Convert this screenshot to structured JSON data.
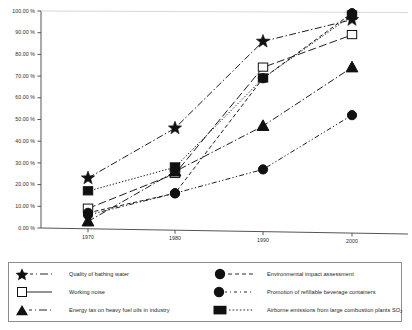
{
  "chart_data": {
    "type": "line",
    "title": "",
    "xlabel": "",
    "ylabel": "",
    "x": [
      1970,
      1980,
      1990,
      2000
    ],
    "categories": [
      "1970",
      "1980",
      "1990",
      "2000"
    ],
    "xtick_labels": [
      "1970",
      "1980",
      "1990",
      "2000"
    ],
    "ytick_labels": [
      "0.00 %",
      "10.00 %",
      "20.00 %",
      "30.00 %",
      "40.00 %",
      "50.00 %",
      "60.00 %",
      "70.00 %",
      "80.00 %",
      "90.00 %",
      "100.00 %"
    ],
    "ytick_values": [
      0,
      10,
      20,
      30,
      40,
      50,
      60,
      70,
      80,
      90,
      100
    ],
    "ylim": [
      0,
      100
    ],
    "xlim": [
      1965,
      2005
    ],
    "grid": false,
    "legend_position": "bottom",
    "series": [
      {
        "name": "Quality of bathing water",
        "marker": "star",
        "marker_fill": "solid",
        "dash": "dash-dot",
        "values": [
          23,
          46,
          86,
          96
        ]
      },
      {
        "name": "Working noise",
        "marker": "square",
        "marker_fill": "open",
        "dash": "long-dash",
        "values": [
          9,
          25,
          74,
          89
        ]
      },
      {
        "name": "Energy tax on heavy fuel oils in industry",
        "marker": "triangle",
        "marker_fill": "solid",
        "dash": "dash-dot",
        "values": [
          3,
          26,
          47,
          74
        ]
      },
      {
        "name": "Environmental impact assessment",
        "marker": "circle",
        "marker_fill": "solid",
        "dash": "dashed",
        "values": [
          7,
          16,
          69,
          99
        ]
      },
      {
        "name": "Promotion of refillable beverage containers",
        "marker": "circle",
        "marker_fill": "solid",
        "dash": "dash-dot-dot",
        "values": [
          6,
          16,
          27,
          52
        ]
      },
      {
        "name": "Airborne emissions from large combustion plants SO2",
        "name_base": "Airborne emissions from large combustion plants SO",
        "name_sub": "2",
        "marker": "square",
        "marker_fill": "solid",
        "dash": "dotted",
        "values": [
          17,
          28,
          69,
          98
        ]
      }
    ]
  },
  "legend": {
    "left_items": [
      {
        "label": "Quality of bathing water"
      },
      {
        "label": "Working noise"
      },
      {
        "label": "Energy tax on heavy fuel oils in industry"
      }
    ],
    "right_items": [
      {
        "label": "Environmental impact assessment"
      },
      {
        "label": "Promotion of refillable beverage containers"
      },
      {
        "label": "Airborne emissions from large combustion plants SO"
      }
    ],
    "right_item_3_sub": "2"
  }
}
